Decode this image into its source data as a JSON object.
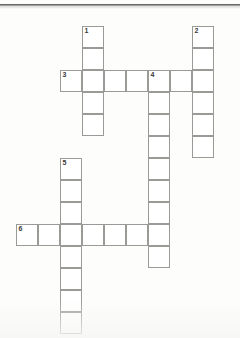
{
  "document": {
    "type": "crossword-grid",
    "title": "Crossword puzzle grid",
    "background_color": "#fdfdfc",
    "cell_fill_color": "#ffffff",
    "grid_line_color": "#9a9a97",
    "number_color": "#3a3a38"
  },
  "grid": {
    "cell_size": 22,
    "origin_x": 16,
    "origin_y": 26,
    "columns": 10,
    "rows": 14
  },
  "entries": [
    {
      "number": "1",
      "direction": "down",
      "start_col": 3,
      "start_row": 0,
      "length": 5
    },
    {
      "number": "2",
      "direction": "down",
      "start_col": 8,
      "start_row": 0,
      "length": 6
    },
    {
      "number": "3",
      "direction": "across",
      "start_col": 2,
      "start_row": 2,
      "length": 7
    },
    {
      "number": "4",
      "direction": "down",
      "start_col": 6,
      "start_row": 2,
      "length": 9
    },
    {
      "number": "5",
      "direction": "down",
      "start_col": 2,
      "start_row": 6,
      "length": 8
    },
    {
      "number": "6",
      "direction": "across",
      "start_col": 0,
      "start_row": 9,
      "length": 7
    }
  ],
  "cells": [
    {
      "col": 3,
      "row": 0,
      "number": "1",
      "letter": ""
    },
    {
      "col": 3,
      "row": 1,
      "number": "",
      "letter": ""
    },
    {
      "col": 3,
      "row": 2,
      "number": "",
      "letter": ""
    },
    {
      "col": 3,
      "row": 3,
      "number": "",
      "letter": ""
    },
    {
      "col": 3,
      "row": 4,
      "number": "",
      "letter": ""
    },
    {
      "col": 8,
      "row": 0,
      "number": "2",
      "letter": ""
    },
    {
      "col": 8,
      "row": 1,
      "number": "",
      "letter": ""
    },
    {
      "col": 8,
      "row": 2,
      "number": "",
      "letter": ""
    },
    {
      "col": 8,
      "row": 3,
      "number": "",
      "letter": ""
    },
    {
      "col": 8,
      "row": 4,
      "number": "",
      "letter": ""
    },
    {
      "col": 8,
      "row": 5,
      "number": "",
      "letter": ""
    },
    {
      "col": 2,
      "row": 2,
      "number": "3",
      "letter": ""
    },
    {
      "col": 4,
      "row": 2,
      "number": "",
      "letter": ""
    },
    {
      "col": 5,
      "row": 2,
      "number": "",
      "letter": ""
    },
    {
      "col": 6,
      "row": 2,
      "number": "4",
      "letter": ""
    },
    {
      "col": 7,
      "row": 2,
      "number": "",
      "letter": ""
    },
    {
      "col": 6,
      "row": 3,
      "number": "",
      "letter": ""
    },
    {
      "col": 6,
      "row": 4,
      "number": "",
      "letter": ""
    },
    {
      "col": 6,
      "row": 5,
      "number": "",
      "letter": ""
    },
    {
      "col": 6,
      "row": 6,
      "number": "",
      "letter": ""
    },
    {
      "col": 6,
      "row": 7,
      "number": "",
      "letter": ""
    },
    {
      "col": 6,
      "row": 8,
      "number": "",
      "letter": ""
    },
    {
      "col": 6,
      "row": 9,
      "number": "",
      "letter": ""
    },
    {
      "col": 6,
      "row": 10,
      "number": "",
      "letter": ""
    },
    {
      "col": 2,
      "row": 6,
      "number": "5",
      "letter": ""
    },
    {
      "col": 2,
      "row": 7,
      "number": "",
      "letter": ""
    },
    {
      "col": 2,
      "row": 8,
      "number": "",
      "letter": ""
    },
    {
      "col": 2,
      "row": 10,
      "number": "",
      "letter": ""
    },
    {
      "col": 2,
      "row": 11,
      "number": "",
      "letter": ""
    },
    {
      "col": 2,
      "row": 12,
      "number": "",
      "letter": ""
    },
    {
      "col": 2,
      "row": 13,
      "number": "",
      "letter": ""
    },
    {
      "col": 0,
      "row": 9,
      "number": "6",
      "letter": ""
    },
    {
      "col": 1,
      "row": 9,
      "number": "",
      "letter": ""
    },
    {
      "col": 2,
      "row": 9,
      "number": "",
      "letter": ""
    },
    {
      "col": 3,
      "row": 9,
      "number": "",
      "letter": ""
    },
    {
      "col": 4,
      "row": 9,
      "number": "",
      "letter": ""
    },
    {
      "col": 5,
      "row": 9,
      "number": "",
      "letter": ""
    }
  ]
}
